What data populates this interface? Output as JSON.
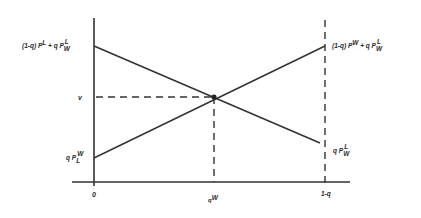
{
  "diagram": {
    "type": "line-diagram",
    "background": "#ffffff",
    "line_color": "#333333",
    "axes": {
      "x_axis": {
        "x1": 72,
        "x2": 350,
        "y": 182
      },
      "y_axis": {
        "x": 94,
        "y1": 18,
        "y2": 186
      },
      "right_boundary_dashed": {
        "x": 325,
        "y1": 20,
        "y2": 186
      }
    },
    "lines": [
      {
        "name": "descending-line",
        "from": [
          94,
          46
        ],
        "to": [
          320,
          143
        ]
      },
      {
        "name": "ascending-line",
        "from": [
          94,
          158
        ],
        "to": [
          325,
          46
        ]
      }
    ],
    "intersection": {
      "x": 214,
      "y": 97
    },
    "guides": [
      {
        "name": "horizontal-dashed-v",
        "from": [
          94,
          97
        ],
        "to": [
          214,
          97
        ]
      },
      {
        "name": "vertical-dashed-qW",
        "from": [
          214,
          97
        ],
        "to": [
          214,
          182
        ]
      }
    ],
    "labels": {
      "left_top": {
        "prefix": "(1-q) P",
        "prefix_sup": "L",
        "plus": "+ q P",
        "sup": "L",
        "sub": "W"
      },
      "left_v": "v",
      "left_bottom": {
        "prefix": "q P",
        "sup": "W",
        "sub": "L"
      },
      "right_top": {
        "prefix": "(1-q) P",
        "prefix_sup": "W",
        "plus": "+ q P",
        "sup": "L",
        "sub": "W"
      },
      "right_bottom": {
        "prefix": "q P",
        "sup": "L",
        "sub": "W"
      },
      "x_origin": "0",
      "x_mid": {
        "base": "q",
        "sup": "W"
      },
      "x_right": "1-q"
    }
  }
}
